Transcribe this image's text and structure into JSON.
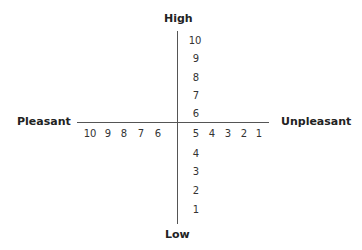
{
  "diagram": {
    "title": "",
    "axes": {
      "top_label": "High",
      "bottom_label": "Low",
      "left_label": "Pleasant",
      "right_label": "Unpleasant"
    },
    "vertical_ticks": [
      "10",
      "9",
      "8",
      "7",
      "6",
      "5",
      "4",
      "3",
      "2",
      "1"
    ],
    "horizontal_ticks_left": [
      "10",
      "9",
      "8",
      "7",
      "6"
    ],
    "horizontal_ticks_right": [
      "5",
      "4",
      "3",
      "2",
      "1"
    ],
    "colors": {
      "axis": "#555555",
      "text": "#222222"
    }
  }
}
